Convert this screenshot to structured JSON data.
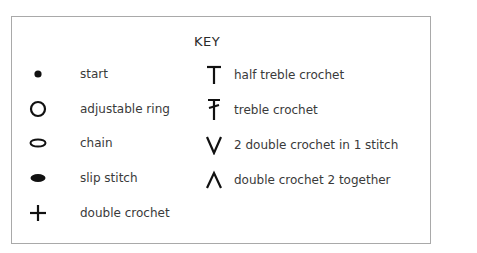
{
  "key": {
    "title": "KEY",
    "left_column": [
      {
        "icon": "dot-icon",
        "label": "start"
      },
      {
        "icon": "circle-icon",
        "label": "adjustable ring"
      },
      {
        "icon": "oval-outline-icon",
        "label": "chain"
      },
      {
        "icon": "filled-oval-icon",
        "label": "slip stitch"
      },
      {
        "icon": "plus-icon",
        "label": "double crochet"
      }
    ],
    "right_column": [
      {
        "icon": "t-icon",
        "label": "half treble crochet"
      },
      {
        "icon": "crossed-t-icon",
        "label": "treble crochet"
      },
      {
        "icon": "v-icon",
        "label": "2 double crochet in 1 stitch"
      },
      {
        "icon": "caret-icon",
        "label": "double crochet 2 together"
      }
    ]
  },
  "colors": {
    "symbol": "#111111",
    "text": "#3a3a3a",
    "border": "#a9a9a9"
  }
}
